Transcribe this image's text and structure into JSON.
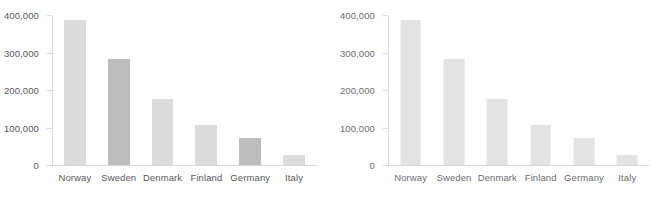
{
  "charts": [
    {
      "id": "left-chart",
      "axis": {
        "ylabel": "",
        "xlabel": "",
        "ymin": 0,
        "ymax": 400000,
        "ticks": [
          0,
          100000,
          200000,
          300000,
          400000
        ],
        "tick_labels": [
          "0",
          "100,000",
          "200,000",
          "300,000",
          "400,000"
        ]
      },
      "categories": [
        "Norway",
        "Sweden",
        "Denmark",
        "Finland",
        "Germany",
        "Italy"
      ],
      "values": [
        390000,
        284000,
        176000,
        107000,
        72000,
        26000
      ],
      "highlighted": [
        "Sweden",
        "Germany"
      ],
      "colors": {
        "bar": "#dcdcdc",
        "bar_highlight": "#bdbdbd",
        "axis": "#d8d8d8",
        "text": "#58595b"
      }
    },
    {
      "id": "right-chart",
      "axis": {
        "ylabel": "",
        "xlabel": "",
        "ymin": 0,
        "ymax": 400000,
        "ticks": [
          0,
          100000,
          200000,
          300000,
          400000
        ],
        "tick_labels": [
          "0",
          "100,000",
          "200,000",
          "300,000",
          "400,000"
        ]
      },
      "categories": [
        "Norway",
        "Sweden",
        "Denmark",
        "Finland",
        "Germany",
        "Italy"
      ],
      "values": [
        390000,
        284000,
        176000,
        107000,
        72000,
        26000
      ],
      "highlighted": [],
      "colors": {
        "bar": "#e3e3e3",
        "bar_highlight": "#e3e3e3",
        "axis": "#dedede",
        "text": "#6b6c6e"
      }
    }
  ],
  "chart_data": [
    {
      "type": "bar",
      "title": "",
      "subtitle": "",
      "xlabel": "",
      "ylabel": "",
      "categories": [
        "Norway",
        "Sweden",
        "Denmark",
        "Finland",
        "Germany",
        "Italy"
      ],
      "values": [
        390000,
        284000,
        176000,
        107000,
        72000,
        26000
      ],
      "ylim": [
        0,
        400000
      ],
      "yticks": [
        0,
        100000,
        200000,
        300000,
        400000
      ],
      "ytick_labels": [
        "0",
        "100,000",
        "200,000",
        "300,000",
        "400,000"
      ],
      "grid": false,
      "legend": "none",
      "highlighted_categories": [
        "Sweden",
        "Germany"
      ],
      "bar_color": "#dcdcdc",
      "highlight_color": "#bdbdbd"
    },
    {
      "type": "bar",
      "title": "",
      "subtitle": "",
      "xlabel": "",
      "ylabel": "",
      "categories": [
        "Norway",
        "Sweden",
        "Denmark",
        "Finland",
        "Germany",
        "Italy"
      ],
      "values": [
        390000,
        284000,
        176000,
        107000,
        72000,
        26000
      ],
      "ylim": [
        0,
        400000
      ],
      "yticks": [
        0,
        100000,
        200000,
        300000,
        400000
      ],
      "ytick_labels": [
        "0",
        "100,000",
        "200,000",
        "300,000",
        "400,000"
      ],
      "grid": false,
      "legend": "none",
      "highlighted_categories": [],
      "bar_color": "#e3e3e3",
      "highlight_color": "#e3e3e3"
    }
  ]
}
